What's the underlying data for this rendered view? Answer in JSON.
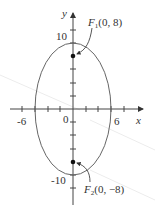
{
  "figure": {
    "type": "ellipse-plot",
    "axes": {
      "x_label": "x",
      "y_label": "y",
      "x_tick_labels": [
        "-6",
        "6"
      ],
      "y_tick_labels": [
        "10",
        "-10"
      ],
      "origin_label": "0"
    },
    "ellipse": {
      "center": [
        0,
        0
      ],
      "a": 6,
      "b": 10
    },
    "foci": [
      {
        "name": "F",
        "sub": "1",
        "coords": "(0, 8)",
        "x": 0,
        "y": 8
      },
      {
        "name": "F",
        "sub": "2",
        "coords": "(0, −8)",
        "x": 0,
        "y": -8
      }
    ],
    "colors": {
      "stroke": "#555555",
      "text": "#333333",
      "point": "#111111"
    }
  }
}
